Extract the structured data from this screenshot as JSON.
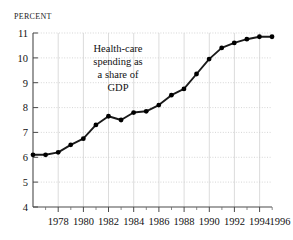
{
  "axis_header": "Percent",
  "chart_data": {
    "type": "line",
    "title": "",
    "subtitle": "",
    "xlabel": "",
    "ylabel": "Percent",
    "ylim": [
      4,
      11
    ],
    "xlim": [
      1977,
      1996
    ],
    "grid": true,
    "legend_position": "none",
    "y_ticks": [
      4,
      5,
      6,
      7,
      8,
      9,
      10,
      11
    ],
    "y_tick_labels": [
      "4",
      "5",
      "6",
      "7",
      "8",
      "9",
      "10",
      "11"
    ],
    "x_ticks": [
      1978,
      1980,
      1982,
      1984,
      1986,
      1988,
      1990,
      1992,
      1994,
      1996
    ],
    "x_tick_labels": [
      "1978",
      "1980",
      "1982",
      "1984",
      "1986",
      "1988",
      "1990",
      "1992",
      "1994",
      "1996"
    ],
    "x_minor_ticks": [
      1977,
      1979,
      1981,
      1983,
      1985,
      1987,
      1989,
      1991,
      1993,
      1995
    ],
    "x": [
      1977,
      1978,
      1979,
      1980,
      1981,
      1982,
      1983,
      1984,
      1985,
      1986,
      1987,
      1988,
      1989,
      1990,
      1991,
      1992,
      1993,
      1994,
      1995,
      1996
    ],
    "values": [
      6.1,
      6.1,
      6.2,
      6.5,
      6.75,
      7.3,
      7.65,
      7.5,
      7.8,
      7.85,
      8.1,
      8.5,
      8.75,
      9.35,
      9.95,
      10.4,
      10.6,
      10.75,
      10.85,
      10.85
    ],
    "series": [
      {
        "name": "Health-care spending as a share of GDP",
        "values": [
          6.1,
          6.1,
          6.2,
          6.5,
          6.75,
          7.3,
          7.65,
          7.5,
          7.8,
          7.85,
          8.1,
          8.5,
          8.75,
          9.35,
          9.95,
          10.4,
          10.6,
          10.75,
          10.85,
          10.85
        ]
      }
    ],
    "annotations": [
      {
        "text": "Health-care spending as a share of GDP",
        "lines": [
          "Health-care",
          "spending as",
          "a share of",
          "GDP"
        ],
        "x": 1983,
        "y": 10.2
      }
    ],
    "colors": {
      "line": "#1a1a1a",
      "marker": "#000000",
      "axis": "#555555",
      "grid": "#c9c9c9",
      "background": "#ffffff"
    }
  },
  "annotation": {
    "line1": "Health-care",
    "line2": "spending as",
    "line3": "a share of",
    "line4": "GDP"
  },
  "y_labels": {
    "l11": "11",
    "l10": "10",
    "l9": "9",
    "l8": "8",
    "l7": "7",
    "l6": "6",
    "l5": "5",
    "l4": "4"
  },
  "x_labels": {
    "x1978": "1978",
    "x1980": "1980",
    "x1982": "1982",
    "x1984": "1984",
    "x1986": "1986",
    "x1988": "1988",
    "x1990": "1990",
    "x1992": "1992",
    "x1994": "1994",
    "x1996": "1996"
  }
}
